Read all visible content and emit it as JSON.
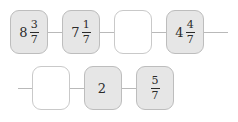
{
  "figure": {
    "type": "number-sequence-chain",
    "background_color": "#ffffff",
    "box_fill_color": "#e6e6e6",
    "blank_box_fill_color": "#ffffff",
    "box_border_color": "#bdbdbd",
    "connector_color": "#b9b9b9",
    "text_color": "#2b2b2b",
    "common_denominator": "7",
    "rows": [
      {
        "id": "row-1",
        "has_lead_connector": false,
        "has_tail_connector": true,
        "terms": [
          {
            "name": "term-1",
            "whole": "8",
            "numerator": "3",
            "denominator": "7",
            "blank": false,
            "value_text": "8 3/7"
          },
          {
            "name": "term-2",
            "whole": "7",
            "numerator": "1",
            "denominator": "7",
            "blank": false,
            "value_text": "7 1/7"
          },
          {
            "name": "term-3",
            "whole": "",
            "numerator": "",
            "denominator": "",
            "blank": true,
            "value_text": ""
          },
          {
            "name": "term-4",
            "whole": "4",
            "numerator": "4",
            "denominator": "7",
            "blank": false,
            "value_text": "4 4/7"
          }
        ]
      },
      {
        "id": "row-2",
        "has_lead_connector": true,
        "has_tail_connector": false,
        "terms": [
          {
            "name": "term-5",
            "whole": "",
            "numerator": "",
            "denominator": "",
            "blank": true,
            "value_text": ""
          },
          {
            "name": "term-6",
            "whole": "2",
            "numerator": "",
            "denominator": "",
            "blank": false,
            "value_text": "2"
          },
          {
            "name": "term-7",
            "whole": "",
            "numerator": "5",
            "denominator": "7",
            "blank": false,
            "value_text": "5/7"
          }
        ]
      }
    ]
  }
}
